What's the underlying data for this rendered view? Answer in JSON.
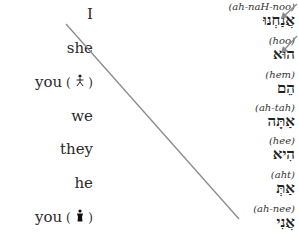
{
  "english_pronouns": [
    {
      "label": "I",
      "figure": ""
    },
    {
      "label": "she",
      "figure": ""
    },
    {
      "label": "you",
      "figure": " ( 🚹 )"
    },
    {
      "label": "we",
      "figure": ""
    },
    {
      "label": "they",
      "figure": ""
    },
    {
      "label": "he",
      "figure": ""
    },
    {
      "label": "you",
      "figure": " ( ♟ )"
    }
  ],
  "hebrew_pronouns": [
    {
      "translit": "(ah-naH-noo)",
      "hebrew": "אֲנַחְנוּ"
    },
    {
      "translit": "(hoo)",
      "hebrew": "הוּא"
    },
    {
      "translit": "(hem)",
      "hebrew": "הֵם"
    },
    {
      "translit": "(ah-tah)",
      "hebrew": "אַתָּה"
    },
    {
      "translit": "(hee)",
      "hebrew": "הִיא"
    },
    {
      "translit": "(aht)",
      "hebrew": "אַתְּ"
    },
    {
      "translit": "(ah-nee)",
      "hebrew": "אֲנִי"
    }
  ],
  "colors": {
    "line": "#8a8a8a",
    "arrow": "#8a8a8a"
  }
}
